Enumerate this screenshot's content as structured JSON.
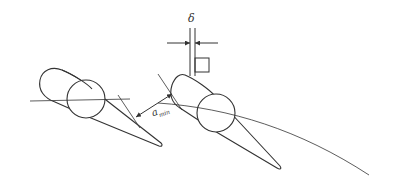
{
  "diagram": {
    "labels": {
      "delta": "δ",
      "a_min_base": "a",
      "a_min_sub": "min"
    },
    "colors": {
      "stroke": "#333333",
      "background": "#ffffff"
    },
    "elements": [
      "left-blade-profile",
      "left-blade-circle",
      "right-blade-profile",
      "right-blade-circle",
      "minimum-gap-dimension",
      "thickness-dimension",
      "square-marker",
      "flow-arc"
    ]
  }
}
